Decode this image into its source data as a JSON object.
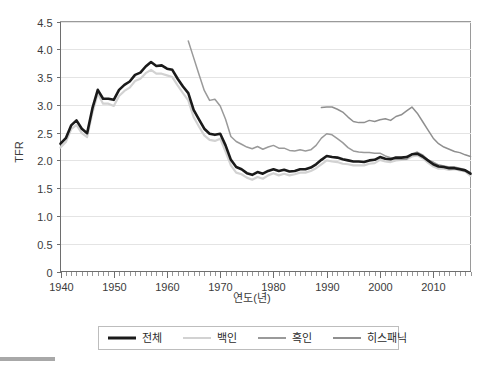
{
  "chart_data": {
    "type": "line",
    "title": "",
    "xlabel": "연도(년)",
    "ylabel": "TFR",
    "xlim": [
      1940,
      2017
    ],
    "ylim": [
      0,
      4.5
    ],
    "grid": true,
    "legend_position": "bottom",
    "x_ticks": [
      "1940",
      "1950",
      "1960",
      "1970",
      "1980",
      "1990",
      "2000",
      "2010"
    ],
    "x_tick_values": [
      1940,
      1950,
      1960,
      1970,
      1980,
      1990,
      2000,
      2010
    ],
    "y_ticks": [
      "0",
      "0.5",
      "1.0",
      "1.5",
      "2.0",
      "2.5",
      "3.0",
      "3.5",
      "4.0",
      "4.5"
    ],
    "y_tick_values": [
      0,
      0.5,
      1.0,
      1.5,
      2.0,
      2.5,
      3.0,
      3.5,
      4.0,
      4.5
    ],
    "series": [
      {
        "name": "전체",
        "color": "#1a1a1a",
        "width": 2.6,
        "x": [
          1940,
          1941,
          1942,
          1943,
          1944,
          1945,
          1946,
          1947,
          1948,
          1949,
          1950,
          1951,
          1952,
          1953,
          1954,
          1955,
          1956,
          1957,
          1958,
          1959,
          1960,
          1961,
          1962,
          1963,
          1964,
          1965,
          1966,
          1967,
          1968,
          1969,
          1970,
          1971,
          1972,
          1973,
          1974,
          1975,
          1976,
          1977,
          1978,
          1979,
          1980,
          1981,
          1982,
          1983,
          1984,
          1985,
          1986,
          1987,
          1988,
          1989,
          1990,
          1991,
          1992,
          1993,
          1994,
          1995,
          1996,
          1997,
          1998,
          1999,
          2000,
          2001,
          2002,
          2003,
          2004,
          2005,
          2006,
          2007,
          2008,
          2009,
          2010,
          2011,
          2012,
          2013,
          2014,
          2015,
          2016,
          2017
        ],
        "values": [
          2.3,
          2.4,
          2.63,
          2.72,
          2.57,
          2.49,
          2.94,
          3.27,
          3.11,
          3.11,
          3.09,
          3.27,
          3.36,
          3.42,
          3.54,
          3.58,
          3.69,
          3.77,
          3.7,
          3.71,
          3.65,
          3.63,
          3.47,
          3.33,
          3.21,
          2.91,
          2.74,
          2.57,
          2.48,
          2.46,
          2.48,
          2.27,
          2.01,
          1.88,
          1.84,
          1.77,
          1.74,
          1.79,
          1.76,
          1.81,
          1.84,
          1.81,
          1.83,
          1.8,
          1.81,
          1.84,
          1.84,
          1.87,
          1.93,
          2.01,
          2.08,
          2.06,
          2.05,
          2.02,
          2.0,
          1.98,
          1.98,
          1.97,
          2.0,
          2.01,
          2.06,
          2.03,
          2.02,
          2.05,
          2.05,
          2.06,
          2.11,
          2.12,
          2.07,
          2.0,
          1.93,
          1.89,
          1.88,
          1.86,
          1.86,
          1.84,
          1.82,
          1.76
        ]
      },
      {
        "name": "백인",
        "color": "#d2d2d2",
        "width": 2.2,
        "x": [
          1940,
          1941,
          1942,
          1943,
          1944,
          1945,
          1946,
          1947,
          1948,
          1949,
          1950,
          1951,
          1952,
          1953,
          1954,
          1955,
          1956,
          1957,
          1958,
          1959,
          1960,
          1961,
          1962,
          1963,
          1964,
          1965,
          1966,
          1967,
          1968,
          1969,
          1970,
          1971,
          1972,
          1973,
          1974,
          1975,
          1976,
          1977,
          1978,
          1979,
          1980,
          1981,
          1982,
          1983,
          1984,
          1985,
          1986,
          1987,
          1988,
          1989,
          1990,
          1991,
          1992,
          1993,
          1994,
          1995,
          1996,
          1997,
          1998,
          1999,
          2000,
          2001,
          2002,
          2003,
          2004,
          2005,
          2006,
          2007,
          2008,
          2009,
          2010,
          2011,
          2012,
          2013,
          2014,
          2015,
          2016,
          2017
        ],
        "values": [
          2.23,
          2.33,
          2.56,
          2.64,
          2.49,
          2.42,
          2.86,
          3.2,
          3.02,
          3.02,
          2.98,
          3.16,
          3.25,
          3.31,
          3.43,
          3.47,
          3.57,
          3.63,
          3.56,
          3.56,
          3.53,
          3.5,
          3.35,
          3.21,
          3.08,
          2.78,
          2.61,
          2.45,
          2.37,
          2.35,
          2.39,
          2.16,
          1.91,
          1.78,
          1.75,
          1.69,
          1.65,
          1.7,
          1.67,
          1.73,
          1.77,
          1.73,
          1.76,
          1.73,
          1.75,
          1.78,
          1.78,
          1.81,
          1.86,
          1.93,
          2.0,
          1.98,
          1.97,
          1.94,
          1.93,
          1.91,
          1.91,
          1.91,
          1.94,
          1.95,
          2.01,
          1.98,
          1.97,
          2.0,
          2.01,
          2.02,
          2.07,
          2.09,
          2.04,
          1.96,
          1.89,
          1.85,
          1.85,
          1.83,
          1.84,
          1.82,
          1.8,
          1.72
        ]
      },
      {
        "name": "흑인",
        "color": "#9a9a9a",
        "width": 1.5,
        "x": [
          1964,
          1965,
          1966,
          1967,
          1968,
          1969,
          1970,
          1971,
          1972,
          1973,
          1974,
          1975,
          1976,
          1977,
          1978,
          1979,
          1980,
          1981,
          1982,
          1983,
          1984,
          1985,
          1986,
          1987,
          1988,
          1989,
          1990,
          1991,
          1992,
          1993,
          1994,
          1995,
          1996,
          1997,
          1998,
          1999,
          2000,
          2001,
          2002,
          2003,
          2004,
          2005,
          2006,
          2007,
          2008,
          2009,
          2010,
          2011,
          2012,
          2013,
          2014,
          2015,
          2016,
          2017
        ],
        "values": [
          4.15,
          3.85,
          3.55,
          3.26,
          3.08,
          3.1,
          2.98,
          2.74,
          2.43,
          2.34,
          2.29,
          2.24,
          2.21,
          2.25,
          2.2,
          2.24,
          2.27,
          2.22,
          2.22,
          2.18,
          2.17,
          2.19,
          2.17,
          2.19,
          2.27,
          2.4,
          2.48,
          2.46,
          2.39,
          2.32,
          2.23,
          2.17,
          2.15,
          2.14,
          2.14,
          2.13,
          2.13,
          2.08,
          2.05,
          2.02,
          2.02,
          2.02,
          2.11,
          2.15,
          2.1,
          2.01,
          1.97,
          1.92,
          1.9,
          1.88,
          1.88,
          1.86,
          1.83,
          1.78
        ]
      },
      {
        "name": "히스패닉",
        "color": "#8f8f8f",
        "width": 1.5,
        "x": [
          1989,
          1990,
          1991,
          1992,
          1993,
          1994,
          1995,
          1996,
          1997,
          1998,
          1999,
          2000,
          2001,
          2002,
          2003,
          2004,
          2005,
          2006,
          2007,
          2008,
          2009,
          2010,
          2011,
          2012,
          2013,
          2014,
          2015,
          2016,
          2017
        ],
        "values": [
          2.95,
          2.96,
          2.96,
          2.92,
          2.87,
          2.78,
          2.7,
          2.68,
          2.68,
          2.72,
          2.7,
          2.73,
          2.75,
          2.72,
          2.79,
          2.82,
          2.89,
          2.96,
          2.85,
          2.7,
          2.55,
          2.4,
          2.3,
          2.24,
          2.2,
          2.16,
          2.14,
          2.1,
          2.07
        ]
      }
    ]
  },
  "legend": {
    "items": [
      {
        "label": "전체"
      },
      {
        "label": "백인"
      },
      {
        "label": "흑인"
      },
      {
        "label": "히스패닉"
      }
    ]
  }
}
